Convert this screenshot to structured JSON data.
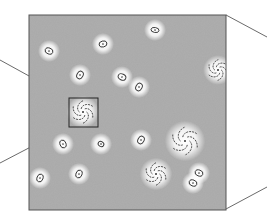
{
  "figure": {
    "background": "#ffffff",
    "field": {
      "x": 29,
      "y": 15,
      "w": 197,
      "h": 195,
      "fill": "#a9a9a9",
      "stroke": "#555555"
    },
    "inset_box": {
      "x": 69,
      "y": 98,
      "w": 29,
      "h": 29
    },
    "colors": {
      "line": "#444444",
      "halo": "#ffffff",
      "galaxy_ink": "#333333"
    },
    "ellipticals": [
      {
        "x": 49,
        "y": 51,
        "rx": 4,
        "ry": 3,
        "rot": 20
      },
      {
        "x": 103,
        "y": 44,
        "rx": 4,
        "ry": 3,
        "rot": -15
      },
      {
        "x": 155,
        "y": 30,
        "rx": 4,
        "ry": 2.5,
        "rot": 10
      },
      {
        "x": 80,
        "y": 75,
        "rx": 3,
        "ry": 4,
        "rot": 30
      },
      {
        "x": 122,
        "y": 77,
        "rx": 4,
        "ry": 3,
        "rot": 25
      },
      {
        "x": 139,
        "y": 87,
        "rx": 3,
        "ry": 4,
        "rot": 30
      },
      {
        "x": 63,
        "y": 144,
        "rx": 3,
        "ry": 4,
        "rot": -20
      },
      {
        "x": 101,
        "y": 144,
        "rx": 3,
        "ry": 2.5,
        "rot": 30
      },
      {
        "x": 141,
        "y": 140,
        "rx": 3,
        "ry": 4,
        "rot": 30
      },
      {
        "x": 40,
        "y": 178,
        "rx": 3,
        "ry": 4,
        "rot": 20
      },
      {
        "x": 79,
        "y": 174,
        "rx": 3,
        "ry": 4,
        "rot": 20
      },
      {
        "x": 199,
        "y": 173,
        "rx": 4,
        "ry": 3,
        "rot": 20
      },
      {
        "x": 193,
        "y": 183,
        "rx": 4,
        "ry": 3,
        "rot": 20
      }
    ],
    "spirals": [
      {
        "x": 83,
        "y": 112,
        "r": 12
      },
      {
        "x": 218,
        "y": 70,
        "r": 11
      },
      {
        "x": 185,
        "y": 141,
        "r": 15
      },
      {
        "x": 156,
        "y": 174,
        "r": 12
      }
    ],
    "lines": [
      {
        "x1": 0,
        "y1": 60,
        "x2": 69,
        "y2": 98
      },
      {
        "x1": 0,
        "y1": 163,
        "x2": 69,
        "y2": 127
      },
      {
        "x1": 226,
        "y1": 15,
        "x2": 267,
        "y2": 37
      },
      {
        "x1": 226,
        "y1": 209,
        "x2": 267,
        "y2": 187
      }
    ]
  }
}
